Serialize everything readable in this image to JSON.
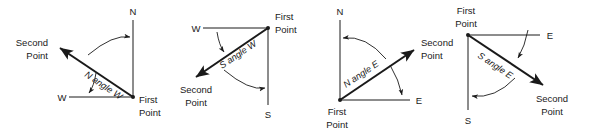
{
  "figure": {
    "background_color": "#ffffff",
    "stroke_color": "#1a1a1a",
    "width": 589,
    "height": 132
  },
  "labels": {
    "first_point_line1": "First",
    "first_point_line2": "Point",
    "second_point_line1": "Second",
    "second_point_line2": "Point",
    "north": "N",
    "south": "S",
    "east": "E",
    "west": "W"
  },
  "diagrams": [
    {
      "id": "nw-quadrant",
      "index": 1,
      "bearing_text": "N angle W",
      "quadrant": "NW",
      "reference_cardinal": "N",
      "secondary_cardinal": "W",
      "origin_label_line1": "First",
      "origin_label_line2": "Point",
      "terminus_label_line1": "Second",
      "terminus_label_line2": "Point",
      "origin_corner": "bottom-right",
      "ray_direction": "up-left"
    },
    {
      "id": "sw-quadrant",
      "index": 2,
      "bearing_text": "S angle W",
      "quadrant": "SW",
      "reference_cardinal": "S",
      "secondary_cardinal": "W",
      "origin_label_line1": "First",
      "origin_label_line2": "Point",
      "terminus_label_line1": "Second",
      "terminus_label_line2": "Point",
      "origin_corner": "top-right",
      "ray_direction": "down-left"
    },
    {
      "id": "ne-quadrant",
      "index": 3,
      "bearing_text": "N angle E",
      "quadrant": "NE",
      "reference_cardinal": "N",
      "secondary_cardinal": "E",
      "origin_label_line1": "First",
      "origin_label_line2": "Point",
      "terminus_label_line1": "Second",
      "terminus_label_line2": "Point",
      "origin_corner": "bottom-left",
      "ray_direction": "up-right"
    },
    {
      "id": "se-quadrant",
      "index": 4,
      "bearing_text": "S angle E",
      "quadrant": "SE",
      "reference_cardinal": "S",
      "secondary_cardinal": "E",
      "origin_label_line1": "First",
      "origin_label_line2": "Point",
      "terminus_label_line1": "Second",
      "terminus_label_line2": "Point",
      "origin_corner": "top-left",
      "ray_direction": "down-right"
    }
  ]
}
